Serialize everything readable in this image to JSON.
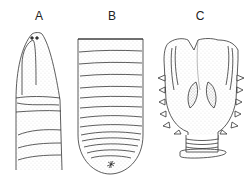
{
  "figure": {
    "panels": [
      {
        "id": "A",
        "label": "A",
        "subject": "anterior end with prostomium"
      },
      {
        "id": "B",
        "label": "B",
        "subject": "posterior end with segments and anus"
      },
      {
        "id": "C",
        "label": "C",
        "subject": "clitellum / sucker-like organ with lateral papillae"
      }
    ]
  },
  "colors": {
    "background": "#ffffff",
    "line": "#333333",
    "stipple": "#777777"
  }
}
